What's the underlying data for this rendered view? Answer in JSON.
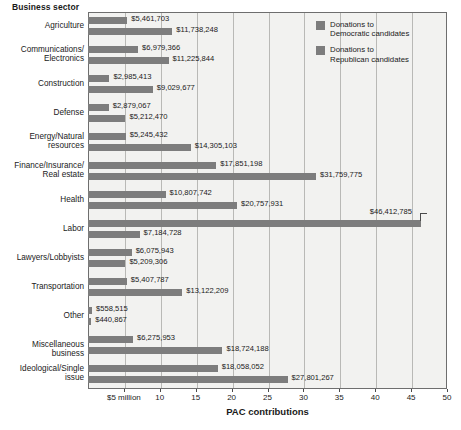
{
  "chart_data": {
    "type": "bar",
    "orientation": "horizontal",
    "title": "",
    "xlabel": "PAC contributions",
    "ylabel": "Business sector",
    "xlim": [
      0,
      50
    ],
    "x_unit": "millions of dollars",
    "grid": true,
    "legend_position": "top-right",
    "x_ticks": [
      {
        "value": 5,
        "label": "$5 million"
      },
      {
        "value": 10,
        "label": "10"
      },
      {
        "value": 15,
        "label": "15"
      },
      {
        "value": 20,
        "label": "20"
      },
      {
        "value": 25,
        "label": "25"
      },
      {
        "value": 30,
        "label": "30"
      },
      {
        "value": 35,
        "label": "35"
      },
      {
        "value": 40,
        "label": "40"
      },
      {
        "value": 45,
        "label": "45"
      },
      {
        "value": 50,
        "label": "50"
      }
    ],
    "categories": [
      "Agriculture",
      "Communications/\nElectronics",
      "Construction",
      "Defense",
      "Energy/Natural\nresources",
      "Finance/Insurance/\nReal estate",
      "Health",
      "Labor",
      "Lawyers/Lobbyists",
      "Transportation",
      "Other",
      "Miscellaneous business",
      "Ideological/Single\nissue"
    ],
    "series": [
      {
        "name": "Donations to Democratic candidates",
        "color": "#7d7d7d",
        "values": [
          5461703,
          6979366,
          2985413,
          2879067,
          5245432,
          17851198,
          10807742,
          46412785,
          6075943,
          5407787,
          558515,
          6275953,
          18058052
        ],
        "labels": [
          "$5,461,703",
          "$6,979,366",
          "$2,985,413",
          "$2,879,067",
          "$5,245,432",
          "$17,851,198",
          "$10,807,742",
          "$46,412,785",
          "$6,075,943",
          "$5,407,787",
          "$558,515",
          "$6,275,953",
          "$18,058,052"
        ]
      },
      {
        "name": "Donations to Republican candidates",
        "color": "#7d7d7d",
        "values": [
          11738248,
          11225844,
          9029677,
          5212470,
          14305103,
          31759775,
          20757931,
          7184728,
          5209306,
          13122209,
          440867,
          18724188,
          27801267
        ],
        "labels": [
          "$11,738,248",
          "$11,225,844",
          "$9,029,677",
          "$5,212,470",
          "$14,305,103",
          "$31,759,775",
          "$20,757,931",
          "$7,184,728",
          "$5,209,306",
          "$13,122,209",
          "$440,867",
          "$18,724,188",
          "$27,801,267"
        ]
      }
    ]
  },
  "legend": {
    "items": [
      {
        "label_line1": "Donations to",
        "label_line2": "Democratic candidates"
      },
      {
        "label_line1": "Donations to",
        "label_line2": "Republican candidates"
      }
    ]
  }
}
